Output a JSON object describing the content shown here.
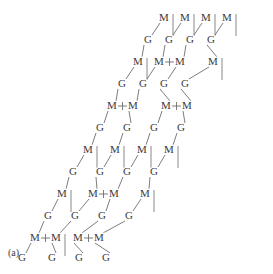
{
  "figure": {
    "caption": "(a)",
    "colors": {
      "background": "#ffffff",
      "text": "#3a3a3a",
      "bond": "#6e6e6e"
    },
    "geometry": {
      "width": 273,
      "height": 274,
      "col_spacing": 21,
      "row_step_x": -13,
      "m_to_g_dx": -10,
      "m_to_g_dy": 20,
      "g_to_m_dx": -11,
      "g_to_m_dy": 20,
      "vertical_stem_length": 22,
      "crosslink_gap": 21
    },
    "labels": {
      "monomer": "M",
      "glycan": "G",
      "crosslink": "I"
    },
    "rows": [
      {
        "index": 0,
        "kind": "M",
        "y": 18,
        "x0": 164,
        "nodes": [
          {
            "label": "M",
            "x": 164,
            "stem": true
          },
          {
            "label": "M",
            "x": 185,
            "stem": true
          },
          {
            "label": "M",
            "x": 206,
            "stem": true
          },
          {
            "label": "M",
            "x": 227,
            "stem": true
          }
        ],
        "crosslinks": []
      },
      {
        "index": 1,
        "kind": "G",
        "y": 40,
        "x0": 148,
        "nodes": [
          {
            "label": "G",
            "x": 148
          },
          {
            "label": "G",
            "x": 169
          },
          {
            "label": "G",
            "x": 190
          },
          {
            "label": "G",
            "x": 211
          }
        ],
        "crosslinks": []
      },
      {
        "index": 2,
        "kind": "M",
        "y": 62,
        "x0": 138,
        "nodes": [
          {
            "label": "M",
            "x": 138,
            "stem": true
          },
          {
            "label": "M",
            "x": 159,
            "stem": false
          },
          {
            "label": "M",
            "x": 180,
            "stem": false
          },
          {
            "label": "M",
            "x": 213,
            "stem": true
          }
        ],
        "crosslinks": [
          {
            "from_x": 159,
            "to_x": 180
          }
        ]
      },
      {
        "index": 3,
        "kind": "G",
        "y": 84,
        "x0": 122,
        "nodes": [
          {
            "label": "G",
            "x": 122
          },
          {
            "label": "G",
            "x": 143
          },
          {
            "label": "G",
            "x": 164
          },
          {
            "label": "G",
            "x": 185
          }
        ],
        "crosslinks": []
      },
      {
        "index": 4,
        "kind": "M",
        "y": 106,
        "x0": 112,
        "nodes": [
          {
            "label": "M",
            "x": 112,
            "stem": false
          },
          {
            "label": "M",
            "x": 133,
            "stem": false
          },
          {
            "label": "M",
            "x": 166,
            "stem": false
          },
          {
            "label": "M",
            "x": 187,
            "stem": false
          }
        ],
        "crosslinks": [
          {
            "from_x": 112,
            "to_x": 133
          },
          {
            "from_x": 166,
            "to_x": 187
          }
        ]
      },
      {
        "index": 5,
        "kind": "G",
        "y": 128,
        "x0": 100,
        "nodes": [
          {
            "label": "G",
            "x": 100
          },
          {
            "label": "G",
            "x": 127
          },
          {
            "label": "G",
            "x": 154
          },
          {
            "label": "G",
            "x": 181
          }
        ],
        "crosslinks": []
      },
      {
        "index": 6,
        "kind": "M",
        "y": 150,
        "x0": 88,
        "nodes": [
          {
            "label": "M",
            "x": 88,
            "stem": true
          },
          {
            "label": "M",
            "x": 115,
            "stem": true
          },
          {
            "label": "M",
            "x": 142,
            "stem": true
          },
          {
            "label": "M",
            "x": 169,
            "stem": true
          }
        ],
        "crosslinks": []
      },
      {
        "index": 7,
        "kind": "G",
        "y": 172,
        "x0": 73,
        "nodes": [
          {
            "label": "G",
            "x": 73
          },
          {
            "label": "G",
            "x": 100
          },
          {
            "label": "G",
            "x": 127
          },
          {
            "label": "G",
            "x": 154
          }
        ],
        "crosslinks": []
      },
      {
        "index": 8,
        "kind": "M",
        "y": 194,
        "x0": 62,
        "nodes": [
          {
            "label": "M",
            "x": 62,
            "stem": true
          },
          {
            "label": "M",
            "x": 93,
            "stem": false
          },
          {
            "label": "M",
            "x": 114,
            "stem": false
          },
          {
            "label": "M",
            "x": 145,
            "stem": true
          }
        ],
        "crosslinks": [
          {
            "from_x": 93,
            "to_x": 114
          }
        ]
      },
      {
        "index": 9,
        "kind": "G",
        "y": 216,
        "x0": 48,
        "nodes": [
          {
            "label": "G",
            "x": 48
          },
          {
            "label": "G",
            "x": 75
          },
          {
            "label": "G",
            "x": 102
          },
          {
            "label": "G",
            "x": 129
          }
        ],
        "crosslinks": []
      },
      {
        "index": 10,
        "kind": "M",
        "y": 238,
        "x0": 35,
        "nodes": [
          {
            "label": "M",
            "x": 35,
            "stem": false
          },
          {
            "label": "M",
            "x": 56,
            "stem": true
          },
          {
            "label": "M",
            "x": 78,
            "stem": false
          },
          {
            "label": "M",
            "x": 99,
            "stem": false
          }
        ],
        "crosslinks": [
          {
            "from_x": 35,
            "to_x": 56
          },
          {
            "from_x": 78,
            "to_x": 99
          }
        ]
      },
      {
        "index": 11,
        "kind": "G",
        "y": 258,
        "x0": 22,
        "nodes": [
          {
            "label": "G",
            "x": 22
          },
          {
            "label": "G",
            "x": 52
          },
          {
            "label": "G",
            "x": 79
          },
          {
            "label": "G",
            "x": 106
          }
        ],
        "crosslinks": []
      }
    ]
  }
}
